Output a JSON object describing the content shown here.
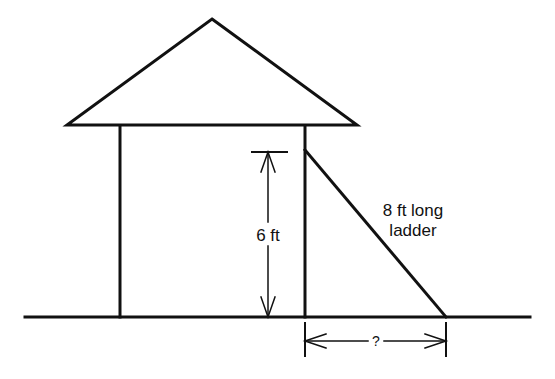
{
  "diagram": {
    "type": "geometry-word-problem",
    "labels": {
      "height": "6 ft",
      "ladder_line1": "8 ft long",
      "ladder_line2": "ladder",
      "unknown_distance": "?"
    },
    "measurements": {
      "wall_height_ft": 6,
      "ladder_length_ft": 8,
      "base_distance": "unknown"
    },
    "colors": {
      "stroke": "#111111",
      "background": "#ffffff"
    }
  }
}
